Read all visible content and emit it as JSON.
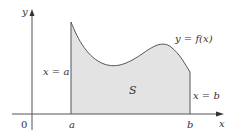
{
  "diagram": {
    "labels": {
      "y_axis": "y",
      "x_axis": "x",
      "origin": "0",
      "a_tick": "a",
      "b_tick": "b",
      "curve": "y = f(x)",
      "left_bound": "x = a",
      "right_bound": "x = b",
      "region": "S"
    },
    "colors": {
      "fill": "#e3e3e3",
      "stroke": "#555555",
      "axis": "#555555",
      "background": "#ffffff"
    }
  }
}
